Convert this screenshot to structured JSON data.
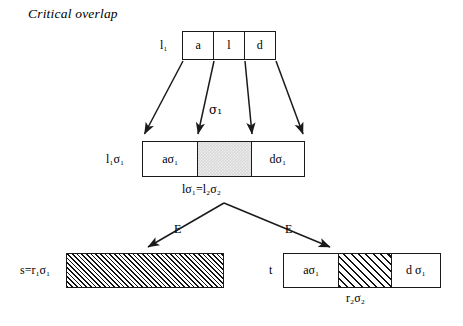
{
  "figure": {
    "title": "Critical overlap",
    "line_color": "#1a1a1a",
    "shade_color": "#d9d9d9",
    "hatch_color": "#111111",
    "background": "#ffffff"
  },
  "top_box": {
    "left_label": "l₁",
    "cells": [
      {
        "label": "a",
        "fill": "white"
      },
      {
        "label": "l",
        "fill": "white"
      },
      {
        "label": "d",
        "fill": "white"
      }
    ]
  },
  "substitution_label": "σ₁",
  "middle_box": {
    "left_label": "l₁σ₁",
    "cells": [
      {
        "label": "aσ₁",
        "fill": "white"
      },
      {
        "label": "",
        "fill": "shaded"
      },
      {
        "label": "dσ₁",
        "fill": "white"
      }
    ],
    "below_label": "lσ₁=l₂σ₂"
  },
  "branch_labels": {
    "left": "E",
    "right": "E"
  },
  "bottom_left_box": {
    "left_label": "s=r₁σ₁",
    "cells": [
      {
        "label": "",
        "fill": "hatch-fine"
      }
    ]
  },
  "bottom_right_box": {
    "left_label": "t",
    "cells": [
      {
        "label": "aσ₁",
        "fill": "white"
      },
      {
        "label": "",
        "fill": "hatch-coarse"
      },
      {
        "label": "d σ₁",
        "fill": "white"
      }
    ],
    "below_label": "r₂σ₂"
  }
}
